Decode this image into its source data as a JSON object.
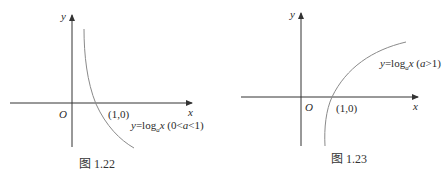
{
  "figures": [
    {
      "id": "fig-1-22",
      "caption": "图 1.22",
      "axis_x_label": "x",
      "axis_y_label": "y",
      "origin_label": "O",
      "point_label": "(1,0)",
      "curve_label": {
        "y": "y",
        "eq": "=log",
        "base": "a",
        "x": "x",
        "cond_open": " (0<",
        "cond_var": "a",
        "cond_close": "<1)"
      }
    },
    {
      "id": "fig-1-23",
      "caption": "图 1.23",
      "axis_x_label": "x",
      "axis_y_label": "y",
      "origin_label": "O",
      "point_label": "(1,0)",
      "curve_label": {
        "y": "y",
        "eq": "=log",
        "base": "a",
        "x": "x",
        "cond_open": " (",
        "cond_var": "a",
        "cond_close": ">1)"
      }
    }
  ],
  "colors": {
    "axis": "#333333",
    "curve": "#8a8a8a",
    "text": "#2a2a2a"
  }
}
